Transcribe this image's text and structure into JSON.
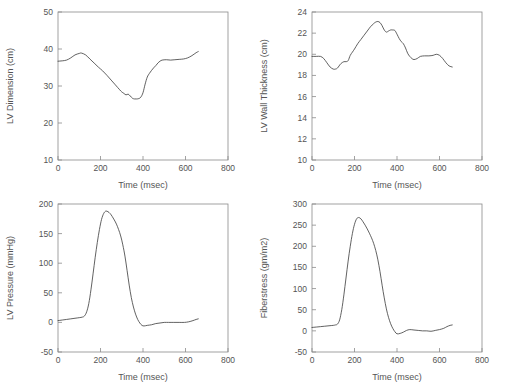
{
  "figure": {
    "background_color": "#ffffff",
    "axis_color": "#8a8a8a",
    "curve_color": "#3a3a3a",
    "layout": "2x2 grid of line plots"
  },
  "chart_data": [
    {
      "type": "line",
      "panel": "top-left",
      "title": "",
      "xlabel": "Time (msec)",
      "ylabel": "LV Dimension (cm)",
      "xlim": [
        0,
        800
      ],
      "ylim": [
        10,
        50
      ],
      "xticks": [
        0,
        200,
        400,
        600,
        800
      ],
      "yticks": [
        10,
        20,
        30,
        40,
        50
      ],
      "grid": false,
      "legend": "none",
      "x": [
        0,
        20,
        40,
        60,
        80,
        100,
        110,
        130,
        150,
        170,
        190,
        210,
        230,
        250,
        270,
        290,
        300,
        310,
        320,
        330,
        340,
        350,
        360,
        370,
        380,
        390,
        400,
        410,
        420,
        430,
        440,
        450,
        460,
        470,
        480,
        490,
        510,
        530,
        550,
        570,
        590,
        610,
        630,
        650,
        660
      ],
      "y": [
        36.7,
        36.8,
        37.0,
        37.6,
        38.4,
        38.8,
        38.9,
        38.4,
        37.3,
        36.2,
        35.1,
        34.1,
        32.9,
        31.6,
        30.3,
        29.0,
        28.4,
        28.0,
        27.6,
        27.8,
        27.3,
        26.7,
        26.5,
        26.5,
        26.6,
        27.0,
        28.2,
        30.5,
        32.4,
        33.4,
        34.2,
        34.9,
        35.5,
        36.2,
        36.7,
        37.0,
        37.1,
        37.0,
        37.1,
        37.2,
        37.3,
        37.6,
        38.2,
        39.0,
        39.3
      ]
    },
    {
      "type": "line",
      "panel": "top-right",
      "title": "",
      "xlabel": "Time (msec)",
      "ylabel": "LV Wall Thickness (cm)",
      "xlim": [
        0,
        800
      ],
      "ylim": [
        10,
        24
      ],
      "xticks": [
        0,
        200,
        400,
        600,
        800
      ],
      "yticks": [
        10,
        12,
        14,
        16,
        18,
        20,
        22,
        24
      ],
      "grid": false,
      "legend": "none",
      "x": [
        0,
        20,
        40,
        55,
        70,
        85,
        100,
        110,
        120,
        135,
        150,
        160,
        170,
        180,
        190,
        200,
        215,
        230,
        245,
        260,
        275,
        290,
        300,
        310,
        320,
        330,
        340,
        350,
        360,
        370,
        380,
        390,
        400,
        410,
        420,
        430,
        440,
        450,
        460,
        470,
        480,
        495,
        510,
        530,
        550,
        570,
        585,
        600,
        615,
        630,
        645,
        660
      ],
      "y": [
        19.8,
        19.8,
        19.8,
        19.6,
        19.2,
        18.8,
        18.6,
        18.6,
        18.7,
        19.1,
        19.3,
        19.3,
        19.4,
        19.9,
        20.2,
        20.5,
        21.0,
        21.4,
        21.8,
        22.2,
        22.6,
        22.9,
        23.05,
        23.1,
        23.0,
        22.7,
        22.3,
        22.1,
        22.2,
        22.3,
        22.3,
        22.25,
        21.9,
        21.5,
        21.2,
        21.0,
        20.6,
        20.1,
        19.8,
        19.6,
        19.5,
        19.6,
        19.8,
        19.85,
        19.85,
        19.9,
        20.0,
        19.9,
        19.6,
        19.2,
        18.9,
        18.8
      ]
    },
    {
      "type": "line",
      "panel": "bottom-left",
      "title": "",
      "xlabel": "Time (msec)",
      "ylabel": "LV Pressure (mmHg)",
      "xlim": [
        0,
        800
      ],
      "ylim": [
        -50,
        200
      ],
      "xticks": [
        0,
        200,
        400,
        600,
        800
      ],
      "yticks": [
        -50,
        0,
        50,
        100,
        150,
        200
      ],
      "grid": false,
      "legend": "none",
      "x": [
        0,
        20,
        40,
        60,
        80,
        100,
        115,
        125,
        135,
        145,
        155,
        165,
        175,
        185,
        195,
        205,
        215,
        225,
        235,
        245,
        255,
        265,
        275,
        285,
        295,
        305,
        315,
        325,
        335,
        345,
        355,
        365,
        375,
        385,
        395,
        405,
        420,
        440,
        460,
        480,
        500,
        520,
        545,
        570,
        595,
        615,
        635,
        650,
        660
      ],
      "y": [
        3,
        4,
        5,
        6,
        7,
        8,
        9,
        11,
        18,
        32,
        55,
        82,
        110,
        135,
        157,
        174,
        184,
        188,
        187,
        184,
        179,
        173,
        166,
        157,
        146,
        131,
        112,
        88,
        63,
        42,
        26,
        14,
        5,
        -1,
        -5,
        -6,
        -5,
        -4,
        -2,
        -1,
        0,
        0,
        0,
        0,
        0,
        1,
        3,
        5,
        6
      ]
    },
    {
      "type": "line",
      "panel": "bottom-right",
      "title": "",
      "xlabel": "Time (msec)",
      "ylabel": "Fiberstress (gm/m2)",
      "xlim": [
        0,
        800
      ],
      "ylim": [
        -50,
        300
      ],
      "xticks": [
        0,
        200,
        400,
        600,
        800
      ],
      "yticks": [
        -50,
        0,
        50,
        100,
        150,
        200,
        250,
        300
      ],
      "grid": false,
      "legend": "none",
      "x": [
        0,
        20,
        40,
        60,
        80,
        100,
        110,
        120,
        130,
        140,
        150,
        160,
        170,
        180,
        190,
        200,
        210,
        220,
        230,
        240,
        250,
        260,
        270,
        280,
        290,
        300,
        310,
        320,
        330,
        340,
        350,
        360,
        370,
        380,
        390,
        400,
        415,
        430,
        445,
        460,
        480,
        500,
        520,
        540,
        560,
        580,
        600,
        620,
        635,
        650,
        660
      ],
      "y": [
        8,
        9,
        10,
        11,
        12,
        13,
        14,
        16,
        26,
        50,
        85,
        125,
        165,
        200,
        230,
        252,
        265,
        268,
        265,
        258,
        250,
        241,
        231,
        220,
        207,
        190,
        168,
        140,
        108,
        78,
        52,
        32,
        17,
        6,
        -2,
        -7,
        -6,
        -3,
        1,
        3,
        2,
        1,
        0,
        0,
        -1,
        1,
        3,
        6,
        10,
        13,
        14
      ]
    }
  ]
}
